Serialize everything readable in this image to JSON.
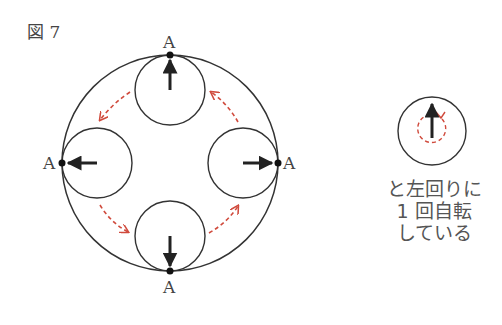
{
  "figure": {
    "title": "図 7",
    "point_label": "A",
    "colors": {
      "stroke": "#333333",
      "path_arrow": "#d04a3c",
      "text": "#555555"
    }
  },
  "main_diagram": {
    "outer_circle": {
      "cx": 170,
      "cy": 163,
      "r": 108
    },
    "small_circles": [
      {
        "position": "top",
        "cx": 170,
        "cy": 90,
        "r": 35,
        "arrow": "up"
      },
      {
        "position": "left",
        "cx": 97,
        "cy": 163,
        "r": 35,
        "arrow": "left"
      },
      {
        "position": "bottom",
        "cx": 170,
        "cy": 236,
        "r": 35,
        "arrow": "down"
      },
      {
        "position": "right",
        "cx": 243,
        "cy": 163,
        "r": 35,
        "arrow": "right"
      }
    ],
    "motion": "counterclockwise"
  },
  "legend": {
    "circle": {
      "cx": 432,
      "cy": 131,
      "r": 34
    },
    "caption_lines": [
      "と左回りに",
      "1 回自転",
      "している"
    ]
  }
}
